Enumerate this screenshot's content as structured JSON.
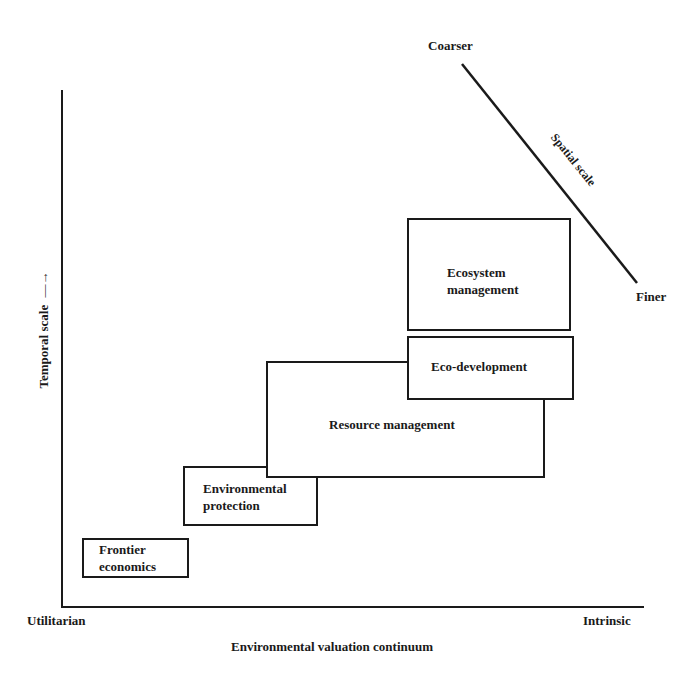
{
  "diagram": {
    "x_axis": {
      "title": "Environmental valuation continuum",
      "left_end": "Utilitarian",
      "right_end": "Intrinsic"
    },
    "y_axis": {
      "title": "Temporal scale",
      "arrow": "→"
    },
    "spatial_scale": {
      "label": "Spatial scale",
      "top": "Coarser",
      "bottom": "Finer"
    },
    "boxes": [
      {
        "id": "frontier",
        "line1": "Frontier",
        "line2": "economics"
      },
      {
        "id": "env_protection",
        "line1": "Environmental",
        "line2": "protection"
      },
      {
        "id": "resource",
        "line1": "Resource management"
      },
      {
        "id": "eco_dev",
        "line1": "Eco-development"
      },
      {
        "id": "ecosystem",
        "line1": "Ecosystem",
        "line2": "management"
      }
    ],
    "colors": {
      "ink": "#1a1a1a",
      "background": "#ffffff"
    }
  }
}
